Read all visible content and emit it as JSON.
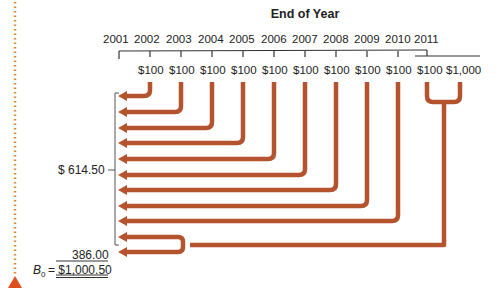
{
  "diagram": {
    "title": "End of Year",
    "years": [
      "2001",
      "2002",
      "2003",
      "2004",
      "2005",
      "2006",
      "2007",
      "2008",
      "2009",
      "2010",
      "2011"
    ],
    "cash_flows": [
      "$100",
      "$100",
      "$100",
      "$100",
      "$100",
      "$100",
      "$100",
      "$100",
      "$100",
      "$100",
      "$1,000"
    ],
    "pv_annuity_label": "$  614.50",
    "pv_par_label": "386.00",
    "total_label_prefix": "B",
    "total_label_sub": "0",
    "total_label_value": "= $1,000.50",
    "colors": {
      "arrow": "#b5532e",
      "dotted_line": "#d98a3a",
      "triangle": "#e0501f",
      "line": "#333333"
    }
  }
}
